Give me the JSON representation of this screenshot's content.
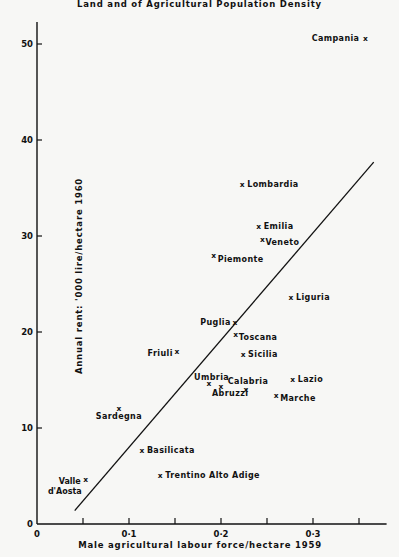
{
  "chart_data": {
    "type": "scatter",
    "title": "Land and of Agricultural Population Density",
    "xlabel": "Male agricultural labour force/hectare 1959",
    "ylabel": "Annual rent: '000 lire/hectare 1960",
    "xlim": [
      0,
      0.38
    ],
    "ylim": [
      0,
      53
    ],
    "xticks": [
      0,
      0.05,
      0.1,
      0.15,
      0.2,
      0.25,
      0.3,
      0.35
    ],
    "xtick_labels": [
      "0",
      "",
      "0·1",
      "",
      "0·2",
      "",
      "0·3",
      ""
    ],
    "yticks": [
      0,
      10,
      20,
      30,
      40,
      50
    ],
    "ytick_labels": [
      "0",
      "10",
      "20",
      "30",
      "40",
      "50"
    ],
    "grid": false,
    "marker": "x",
    "points": [
      {
        "label": "Campania",
        "x": 0.357,
        "y": 50.6
      },
      {
        "label": "Lombardia",
        "x": 0.223,
        "y": 35.4
      },
      {
        "label": "Emilia",
        "x": 0.241,
        "y": 31.0
      },
      {
        "label": "Veneto",
        "x": 0.245,
        "y": 29.7
      },
      {
        "label": "Piemonte",
        "x": 0.192,
        "y": 28.0
      },
      {
        "label": "Liguria",
        "x": 0.276,
        "y": 23.6
      },
      {
        "label": "Puglia",
        "x": 0.215,
        "y": 21.0
      },
      {
        "label": "Toscana",
        "x": 0.216,
        "y": 19.8
      },
      {
        "label": "Sicilia",
        "x": 0.224,
        "y": 17.7
      },
      {
        "label": "Friuli",
        "x": 0.152,
        "y": 18.0
      },
      {
        "label": "Umbria",
        "x": 0.187,
        "y": 14.7
      },
      {
        "label": "Abruzzi",
        "x": 0.2,
        "y": 14.4
      },
      {
        "label": "Calabria",
        "x": 0.227,
        "y": 14.1
      },
      {
        "label": "Lazio",
        "x": 0.278,
        "y": 15.1
      },
      {
        "label": "Marche",
        "x": 0.26,
        "y": 13.4
      },
      {
        "label": "Sardegna",
        "x": 0.089,
        "y": 12.1
      },
      {
        "label": "Basilicata",
        "x": 0.114,
        "y": 7.7
      },
      {
        "label": "Trentino Alto Adige",
        "x": 0.134,
        "y": 5.1
      },
      {
        "label": "Valle d'Aosta",
        "x": 0.053,
        "y": 4.7
      }
    ],
    "regression_line": {
      "x": [
        0.041,
        0.366
      ],
      "y": [
        1.4,
        37.7
      ]
    }
  }
}
